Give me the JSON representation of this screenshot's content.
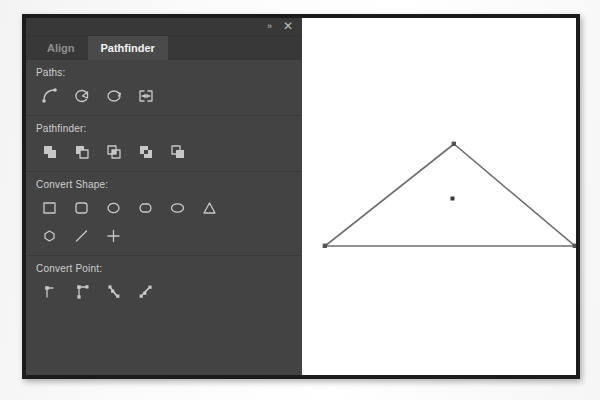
{
  "window": {
    "title": "Pathfinder",
    "collapse_icon": "double-chevron-right-icon",
    "close_icon": "close-icon",
    "collapse_glyph": "»",
    "close_glyph": "✕"
  },
  "tabs": [
    {
      "label": "Align",
      "active": false
    },
    {
      "label": "Pathfinder",
      "active": true
    }
  ],
  "sections": [
    {
      "label": "Paths:",
      "name": "paths",
      "items": [
        {
          "icon": "join-path-icon",
          "label": "Join"
        },
        {
          "icon": "open-path-icon",
          "label": "Open Path"
        },
        {
          "icon": "close-path-icon",
          "label": "Close Path"
        },
        {
          "icon": "reverse-path-icon",
          "label": "Reverse Path"
        }
      ]
    },
    {
      "label": "Pathfinder:",
      "name": "pathfinder",
      "items": [
        {
          "icon": "add-shape-icon",
          "label": "Add"
        },
        {
          "icon": "subtract-shape-icon",
          "label": "Subtract"
        },
        {
          "icon": "intersect-shape-icon",
          "label": "Intersect"
        },
        {
          "icon": "exclude-overlap-icon",
          "label": "Exclude Overlap"
        },
        {
          "icon": "minus-back-icon",
          "label": "Minus Back"
        }
      ]
    },
    {
      "label": "Convert Shape:",
      "name": "convert-shape",
      "items": [
        {
          "icon": "rectangle-icon",
          "label": "Rectangle"
        },
        {
          "icon": "rounded-rectangle-icon",
          "label": "Rounded Rectangle"
        },
        {
          "icon": "beveled-rectangle-icon",
          "label": "Beveled Rectangle"
        },
        {
          "icon": "inverse-rounded-rectangle-icon",
          "label": "Inverse Rounded Rectangle"
        },
        {
          "icon": "ellipse-icon",
          "label": "Ellipse"
        },
        {
          "icon": "triangle-icon",
          "label": "Triangle"
        },
        {
          "icon": "polygon-icon",
          "label": "Polygon"
        },
        {
          "icon": "line-icon",
          "label": "Line"
        },
        {
          "icon": "orthogonal-line-icon",
          "label": "Orthogonal Line"
        }
      ]
    },
    {
      "label": "Convert Point:",
      "name": "convert-point",
      "items": [
        {
          "icon": "plain-point-icon",
          "label": "Plain"
        },
        {
          "icon": "corner-point-icon",
          "label": "Corner"
        },
        {
          "icon": "smooth-point-icon",
          "label": "Smooth"
        },
        {
          "icon": "symmetrical-point-icon",
          "label": "Symmetrical"
        }
      ]
    }
  ],
  "canvas": {
    "name": "document-canvas",
    "background": "#ffffff",
    "shape": {
      "name": "triangle-path",
      "type": "triangle",
      "stroke": "#6e6e6e",
      "fill": "none",
      "anchor_points": [
        {
          "x": 144,
          "y": 126
        },
        {
          "x": 15,
          "y": 228
        },
        {
          "x": 265,
          "y": 228
        }
      ],
      "center_point": {
        "x": 142,
        "y": 181
      }
    }
  },
  "colors": {
    "panel_bg": "#434343",
    "panel_bar_bg": "#383838",
    "tab_active_bg": "#4a4a4a",
    "tab_active_text": "#f2f2f2",
    "tab_inactive_text": "#8e8e8e",
    "icon_stroke": "#c8c8c8",
    "frame": "#1b1b1b",
    "canvas_bg": "#ffffff",
    "shape_stroke": "#6e6e6e"
  }
}
